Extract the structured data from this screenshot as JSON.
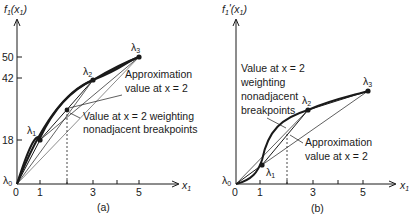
{
  "panels": [
    {
      "id": "a",
      "caption": "(a)",
      "y_axis_label": "f",
      "y_axis_label_sub": "1",
      "y_axis_label_arg": "(x",
      "y_axis_label_arg_sub": "1",
      "y_axis_label_close": ")",
      "x_axis_label": "x",
      "x_axis_label_sub": "1",
      "x_ticks": [
        "0",
        "1",
        "3",
        "5"
      ],
      "y_ticks": [
        "18",
        "42",
        "50"
      ],
      "breakpoints": [
        {
          "label": "λ",
          "sub": "0",
          "x": 0,
          "y": 0
        },
        {
          "label": "λ",
          "sub": "1",
          "x": 1,
          "y": 18
        },
        {
          "label": "λ",
          "sub": "2",
          "x": 3,
          "y": 42
        },
        {
          "label": "λ",
          "sub": "3",
          "x": 5,
          "y": 50
        }
      ],
      "annotation_1": {
        "line1": "Approximation",
        "line2": "value at x = 2"
      },
      "annotation_2": {
        "line1": "Value at x = 2 weighting",
        "line2": "nonadjacent breakpoints"
      }
    },
    {
      "id": "b",
      "caption": "(b)",
      "y_axis_label": "f",
      "y_axis_label_sub": "1",
      "y_axis_label_prime": "'",
      "y_axis_label_arg": "(x",
      "y_axis_label_arg_sub": "1",
      "y_axis_label_close": ")",
      "x_axis_label": "x",
      "x_axis_label_sub": "1",
      "x_ticks": [
        "0",
        "1",
        "3",
        "5"
      ],
      "breakpoints": [
        {
          "label": "λ",
          "sub": "0"
        },
        {
          "label": "λ",
          "sub": "1"
        },
        {
          "label": "λ",
          "sub": "2"
        },
        {
          "label": "λ",
          "sub": "3"
        }
      ],
      "annotation_1": {
        "line1": "Value at x = 2",
        "line2": "weighting",
        "line3": "nonadjacent",
        "line4": "breakpoints"
      },
      "annotation_2": {
        "line1": "Approximation",
        "line2": "value at x = 2"
      }
    }
  ]
}
